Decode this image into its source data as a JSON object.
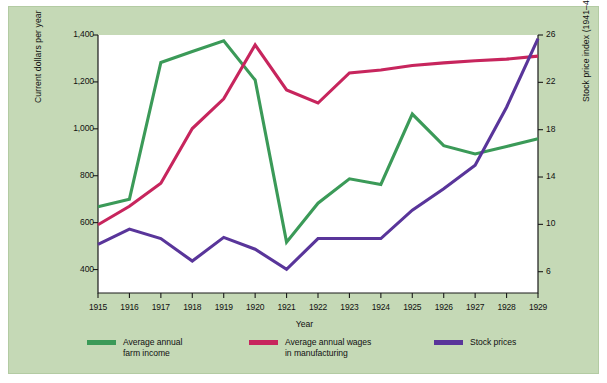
{
  "chart_data": {
    "type": "line",
    "title": "",
    "xlabel": "Year",
    "ylabel": "Current dollars per year",
    "y2label": "Stock price index (1941–43 = 100)",
    "x": [
      1915,
      1916,
      1917,
      1918,
      1919,
      1920,
      1921,
      1922,
      1923,
      1924,
      1925,
      1926,
      1927,
      1928,
      1929
    ],
    "xtick_labels": [
      "1915",
      "1916",
      "1917",
      "1918",
      "1919",
      "1920",
      "1921",
      "1922",
      "1923",
      "1924",
      "1925",
      "1926",
      "1927",
      "1928",
      "1929"
    ],
    "xlim": [
      1915,
      1929
    ],
    "ylim": [
      300,
      1400
    ],
    "ytick_values": [
      400,
      600,
      800,
      1000,
      1200,
      1400
    ],
    "ytick_labels": [
      "400",
      "600",
      "800",
      "1,000",
      "1,200",
      "1,400"
    ],
    "y2lim": [
      4.2,
      26
    ],
    "y2tick_values": [
      6,
      10,
      14,
      18,
      22,
      26
    ],
    "y2tick_labels": [
      "6",
      "10",
      "14",
      "18",
      "22",
      "26"
    ],
    "grid": false,
    "legend_position": "below",
    "series": [
      {
        "name": "Average annual\nfarm income",
        "legend_label": "Average annual\nfarm income",
        "color": "#3b9a58",
        "axis": "left",
        "values": [
          668,
          700,
          1283,
          1330,
          1375,
          1208,
          517,
          683,
          787,
          763,
          1063,
          928,
          893,
          925,
          958
        ]
      },
      {
        "name": "Average annual wages\nin manufacturing",
        "legend_label": "Average annual wages\nin manufacturing",
        "color": "#c7255d",
        "axis": "left",
        "values": [
          591,
          670,
          768,
          1001,
          1128,
          1358,
          1166,
          1110,
          1238,
          1251,
          1270,
          1281,
          1290,
          1297,
          1310
        ]
      },
      {
        "name": "Stock prices",
        "legend_label": "Stock prices",
        "color": "#59359a",
        "axis": "right",
        "values": [
          8.3,
          9.6,
          8.8,
          6.9,
          8.9,
          7.9,
          6.2,
          8.8,
          8.8,
          8.8,
          11.2,
          13.0,
          15.0,
          19.9,
          25.7
        ]
      }
    ]
  }
}
